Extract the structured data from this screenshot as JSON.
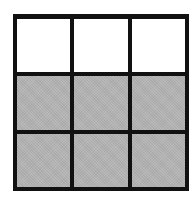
{
  "diagram": {
    "type": "3x3 grid",
    "rows": 3,
    "columns": 3,
    "colors": {
      "border": "#111111",
      "empty": "#ffffff",
      "shaded": "#b4b4b4"
    },
    "cells": [
      [
        "empty",
        "empty",
        "empty"
      ],
      [
        "shaded",
        "shaded",
        "shaded"
      ],
      [
        "shaded",
        "shaded",
        "shaded"
      ]
    ],
    "shaded_count": 6,
    "total_count": 9
  }
}
